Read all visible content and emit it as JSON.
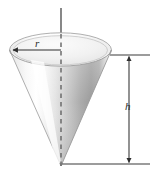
{
  "figure": {
    "name": "right-circular-cone-diagram",
    "width": 167,
    "height": 183,
    "background_color": "#ffffff"
  },
  "labels": {
    "radius": "r",
    "height": "h"
  },
  "colors": {
    "background": "#ffffff",
    "outline": "#8c8c8c",
    "axis_line": "#555555",
    "dimension_line": "#3a3a3a",
    "label_text": "#2b2b2b",
    "cone_shadow": "#9a9a9a",
    "cone_highlight": "#ffffff",
    "cone_midtone": "#d9d9d9",
    "opening_fill": "#f2f2f2",
    "rim_fill": "#fdfdfd"
  },
  "geometry": {
    "top_ellipse": {
      "cx": 60.5,
      "cy": 50,
      "rx": 51,
      "ry": 17
    },
    "apex": {
      "x": 61,
      "y": 166
    },
    "axis": {
      "x": 61,
      "top_y": 8,
      "solid_to_y": 33,
      "bottom_y": 166
    },
    "radius_arrow": {
      "y": 50,
      "from_x": 61,
      "to_x": 12
    },
    "height_dimension": {
      "x": 129,
      "top_y": 55,
      "bottom_y": 164
    },
    "extension_top": {
      "y": 55,
      "from_x": 110,
      "to_x": 150
    },
    "extension_bottom": {
      "y": 164,
      "from_x": 62,
      "to_x": 150
    }
  },
  "icon_names": {
    "cone_solid": "cone-shape-icon",
    "radius_arrow": "radius-arrow-icon",
    "height_arrow": "height-double-arrow-icon",
    "center_axis": "dashed-axis-icon"
  }
}
